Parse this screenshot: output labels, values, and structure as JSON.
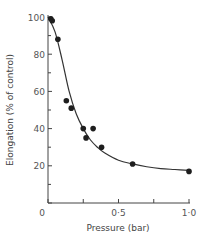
{
  "chart_data": {
    "type": "scatter",
    "title": "",
    "xlabel": "Pressure (bar)",
    "ylabel": "Elongation (% of control)",
    "xlim": [
      0,
      1.0
    ],
    "ylim": [
      0,
      100
    ],
    "x_ticks": [
      0,
      0.25,
      0.5,
      0.75,
      1.0
    ],
    "x_tick_labels": [
      "0",
      "",
      "0·5",
      "",
      "1·0"
    ],
    "y_ticks": [
      0,
      10,
      20,
      30,
      40,
      50,
      60,
      70,
      80,
      90,
      100
    ],
    "y_tick_labels": [
      "0",
      "",
      "20",
      "",
      "40",
      "",
      "60",
      "",
      "80",
      "",
      "100"
    ],
    "grid": false,
    "legend": null,
    "series": [
      {
        "name": "measured",
        "type": "scatter",
        "x": [
          0.02,
          0.03,
          0.07,
          0.13,
          0.165,
          0.25,
          0.27,
          0.32,
          0.38,
          0.6,
          1.0
        ],
        "y": [
          99,
          98,
          88,
          55,
          51,
          40,
          35,
          40,
          30,
          21,
          17
        ]
      },
      {
        "name": "fitted curve",
        "type": "line",
        "x": [
          0.0,
          0.05,
          0.1,
          0.15,
          0.2,
          0.25,
          0.3,
          0.35,
          0.4,
          0.5,
          0.6,
          0.7,
          0.8,
          0.9,
          1.0
        ],
        "y": [
          100,
          92,
          77,
          60,
          48,
          40,
          34,
          30,
          27,
          23,
          21,
          19.5,
          18.5,
          18,
          17.5
        ]
      }
    ]
  }
}
